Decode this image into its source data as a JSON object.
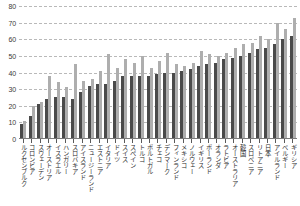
{
  "chart_data": {
    "type": "bar",
    "title": "",
    "subtitle": "",
    "xlabel": "",
    "ylabel": "",
    "ylim": [
      0,
      80
    ],
    "ytick_step": 10,
    "yticks": [
      0,
      10,
      20,
      30,
      40,
      50,
      60,
      70,
      80
    ],
    "ytick_labels": [
      "0",
      "10",
      "20",
      "30",
      "40",
      "50",
      "60",
      "70",
      "80"
    ],
    "grid": true,
    "grid_axis": "y",
    "legend": null,
    "legend_position": "none",
    "orientation": "vertical",
    "grouping": "grouped",
    "categories": [
      "ルクセンブルク",
      "コロンビア",
      "スウェーデン",
      "オーストリア",
      "イスラエル",
      "ハンガリー",
      "スロバキア",
      "アイスランド",
      "ニュージーランド",
      "エストニア",
      "イタリア",
      "ドイツ",
      "スイス",
      "スペイン",
      "トルコ",
      "ポルトガル",
      "チェコ",
      "デンマーク",
      "フィンランド",
      "メキシコ",
      "ノルウェー",
      "イギリス",
      "ポーランド",
      "オランダ",
      "ラトビア",
      "オーストラリア",
      "韓国",
      "スロベニア",
      "リトアニア",
      "日本",
      "アイルランド",
      "ベルギー",
      "ギリシア"
    ],
    "series": [
      {
        "name": "series-1",
        "color": "#4a4a4a",
        "values": [
          9,
          14,
          21,
          24,
          25,
          25,
          24,
          28,
          32,
          33,
          33,
          35,
          38,
          38,
          38,
          38,
          39,
          40,
          40,
          41,
          42,
          44,
          45,
          46,
          48,
          49,
          50,
          52,
          54,
          55,
          57,
          60,
          62
        ]
      },
      {
        "name": "series-2",
        "color": "#aeaeae",
        "values": [
          11,
          20,
          22,
          38,
          34,
          31,
          45,
          35,
          36,
          41,
          51,
          43,
          48,
          46,
          50,
          43,
          47,
          52,
          45,
          44,
          46,
          53,
          51,
          50,
          52,
          55,
          57,
          58,
          62,
          60,
          70,
          66,
          73
        ]
      }
    ]
  }
}
